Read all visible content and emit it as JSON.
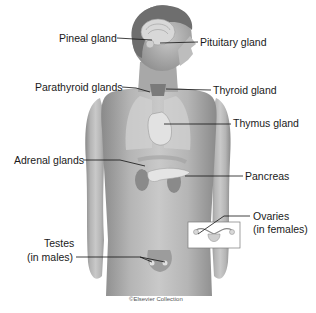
{
  "diagram": {
    "labels": {
      "pineal": "Pineal gland",
      "pituitary": "Pituitary gland",
      "parathyroid": "Parathyroid glands",
      "thyroid": "Thyroid gland",
      "thymus": "Thymus gland",
      "adrenal": "Adrenal glands",
      "pancreas": "Pancreas",
      "ovaries_line1": "Ovaries",
      "ovaries_line2": "(in females)",
      "testes_line1": "Testes",
      "testes_line2": "(in males)"
    },
    "credit": "©Elsevier Collection",
    "colors": {
      "skin": "#b9b9b9",
      "skin_dark": "#8f8f8f",
      "hair": "#6e6e6e",
      "organ": "#d6d6d6",
      "line": "#111111"
    }
  }
}
